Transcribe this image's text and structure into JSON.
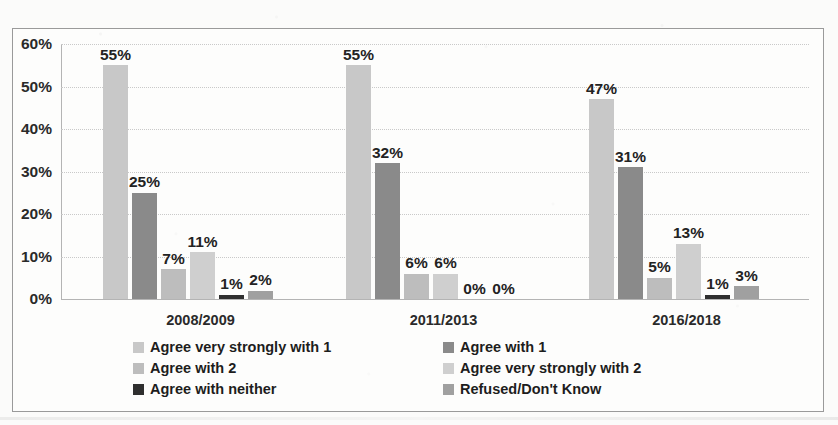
{
  "scan": {
    "top_cut_caption": "",
    "background_color": "#fbfbfa",
    "frame_border_color": "#9a9a9a"
  },
  "chart_data": {
    "type": "bar",
    "title": "",
    "subtitle": "",
    "xlabel": "",
    "ylabel": "",
    "grid": true,
    "legend_position": "bottom",
    "ylim": [
      0,
      60
    ],
    "ytick_labels": [
      "60%",
      "50%",
      "40%",
      "30%",
      "20%",
      "10%",
      "0%"
    ],
    "ytick_values": [
      60,
      50,
      40,
      30,
      20,
      10,
      0
    ],
    "categories": [
      "2008/2009",
      "2011/2013",
      "2016/2018"
    ],
    "series": [
      {
        "name": "Agree very strongly with 1",
        "color": "#c8c8c8",
        "values": [
          55,
          55,
          47
        ],
        "labels": [
          "55%",
          "55%",
          "47%"
        ]
      },
      {
        "name": "Agree with 1",
        "color": "#8a8a8a",
        "values": [
          25,
          32,
          31
        ],
        "labels": [
          "25%",
          "32%",
          "31%"
        ]
      },
      {
        "name": "Agree with 2",
        "color": "#bdbdbd",
        "values": [
          7,
          6,
          5
        ],
        "labels": [
          "7%",
          "6%",
          "5%"
        ]
      },
      {
        "name": "Agree very strongly with 2",
        "color": "#cfcfcf",
        "values": [
          11,
          6,
          13
        ],
        "labels": [
          "11%",
          "6%",
          "13%"
        ]
      },
      {
        "name": "Agree with neither",
        "color": "#2f2f2f",
        "values": [
          1,
          0,
          1
        ],
        "labels": [
          "1%",
          "0%",
          "1%"
        ]
      },
      {
        "name": "Refused/Don't Know",
        "color": "#a0a0a0",
        "values": [
          2,
          0,
          3
        ],
        "labels": [
          "2%",
          "0%",
          "3%"
        ]
      }
    ],
    "legend_order": [
      "Agree very strongly with 1",
      "Agree with 1",
      "Agree with 2",
      "Agree very strongly with 2",
      "Agree with neither",
      "Refused/Don't Know"
    ]
  }
}
